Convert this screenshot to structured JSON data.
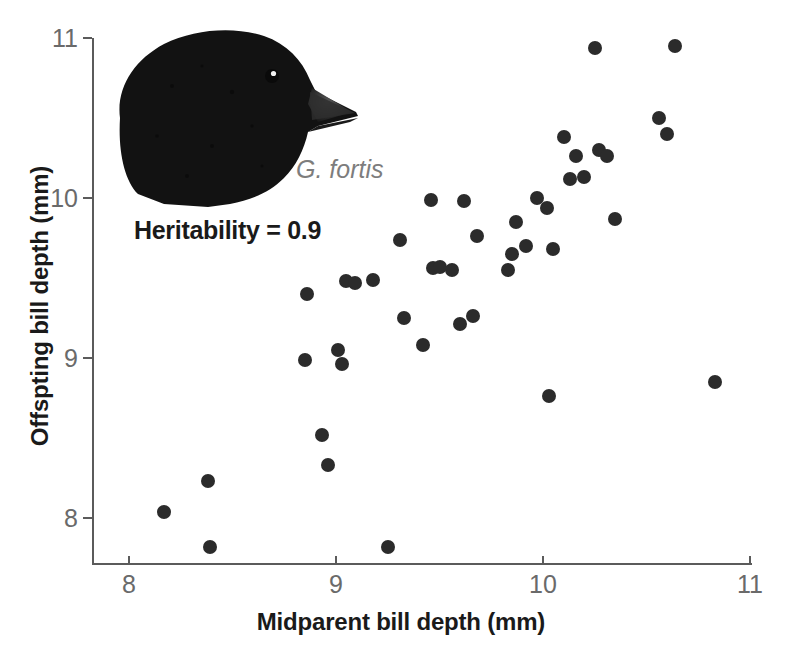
{
  "figure": {
    "bird_image_alt": "Dark finch head photograph, Geospiza fortis",
    "species_label": "G. fortis",
    "heritability_note": "Heritability = 0.9"
  },
  "chart_data": {
    "type": "scatter",
    "title": "",
    "xlabel": "Midparent bill depth (mm)",
    "ylabel": "Offspting bill depth (mm)",
    "xlim": [
      7.78,
      11.12
    ],
    "ylim": [
      7.72,
      11.12
    ],
    "xticks": [
      8,
      9,
      10,
      11
    ],
    "yticks": [
      8,
      9,
      10,
      11
    ],
    "xticklabels": [
      "8",
      "9",
      "10",
      "11"
    ],
    "yticklabels": [
      "8",
      "9",
      "10",
      "11"
    ],
    "grid": false,
    "legend": "none",
    "marker": "filled-circle",
    "marker_color": "#2b2b2b",
    "marker_size_px": 14,
    "n_points": 44,
    "points": [
      [
        8.17,
        8.04
      ],
      [
        8.38,
        8.23
      ],
      [
        8.39,
        7.82
      ],
      [
        8.85,
        8.99
      ],
      [
        8.86,
        9.4
      ],
      [
        8.93,
        8.52
      ],
      [
        8.96,
        8.33
      ],
      [
        9.01,
        9.05
      ],
      [
        9.03,
        8.96
      ],
      [
        9.05,
        9.48
      ],
      [
        9.18,
        9.49
      ],
      [
        9.25,
        7.82
      ],
      [
        9.31,
        9.74
      ],
      [
        9.33,
        9.25
      ],
      [
        9.42,
        9.08
      ],
      [
        9.46,
        9.99
      ],
      [
        9.47,
        9.56
      ],
      [
        9.56,
        9.55
      ],
      [
        9.6,
        9.21
      ],
      [
        9.62,
        9.98
      ],
      [
        9.66,
        9.26
      ],
      [
        9.68,
        9.76
      ],
      [
        9.83,
        9.55
      ],
      [
        9.85,
        9.65
      ],
      [
        9.87,
        9.85
      ],
      [
        9.97,
        10.0
      ],
      [
        10.02,
        9.94
      ],
      [
        10.03,
        8.76
      ],
      [
        10.05,
        9.68
      ],
      [
        10.1,
        10.38
      ],
      [
        10.13,
        10.12
      ],
      [
        10.16,
        10.26
      ],
      [
        10.25,
        10.94
      ],
      [
        10.27,
        10.3
      ],
      [
        10.31,
        10.26
      ],
      [
        10.35,
        9.87
      ],
      [
        10.56,
        10.5
      ],
      [
        10.6,
        10.4
      ],
      [
        10.64,
        10.95
      ],
      [
        10.83,
        8.85
      ],
      [
        9.92,
        9.7
      ],
      [
        9.5,
        9.57
      ],
      [
        9.09,
        9.47
      ],
      [
        10.2,
        10.13
      ]
    ]
  }
}
